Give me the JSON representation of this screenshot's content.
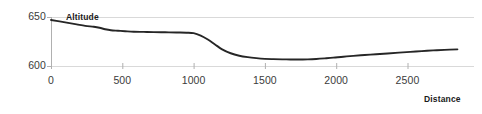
{
  "chart_data": {
    "type": "line",
    "title": "",
    "xlabel": "Distance",
    "ylabel": "Altitude",
    "xlim": [
      0,
      2890
    ],
    "ylim": [
      595,
      655
    ],
    "xticks": [
      0,
      500,
      1000,
      1500,
      2000,
      2500
    ],
    "xticklabels": [
      "0",
      "500",
      "1000",
      "1500",
      "2000",
      "2500"
    ],
    "yticks": [
      600,
      650
    ],
    "yticklabels": [
      "600",
      "650"
    ],
    "grid": "horizontal-only",
    "legend": "none",
    "line_color": "#262626",
    "grid_color": "#d9d9d9",
    "axis_color": "#b0b0b0",
    "series": [
      {
        "name": "Altitude",
        "x": [
          0,
          60,
          120,
          180,
          240,
          300,
          340,
          380,
          420,
          470,
          520,
          580,
          650,
          720,
          800,
          880,
          950,
          1000,
          1050,
          1100,
          1150,
          1200,
          1260,
          1320,
          1380,
          1440,
          1500,
          1560,
          1620,
          1680,
          1740,
          1800,
          1860,
          1920,
          1980,
          2050,
          2120,
          2200,
          2280,
          2360,
          2440,
          2520,
          2600,
          2680,
          2760,
          2850
        ],
        "values": [
          647,
          645.5,
          644,
          642.5,
          641,
          640,
          639,
          637.5,
          636.5,
          636,
          635.5,
          635,
          634.8,
          634.6,
          634.4,
          634.2,
          634,
          633.5,
          631,
          627,
          622,
          617,
          613,
          610.5,
          609,
          608,
          607.3,
          607,
          606.8,
          606.7,
          606.6,
          606.8,
          607.2,
          607.8,
          608.5,
          609.5,
          610.3,
          611.2,
          612,
          612.8,
          613.6,
          614.4,
          615.2,
          615.9,
          616.5,
          617
        ]
      }
    ]
  },
  "labels": {
    "y_axis_title": "Altitude",
    "x_axis_title": "Distance"
  }
}
